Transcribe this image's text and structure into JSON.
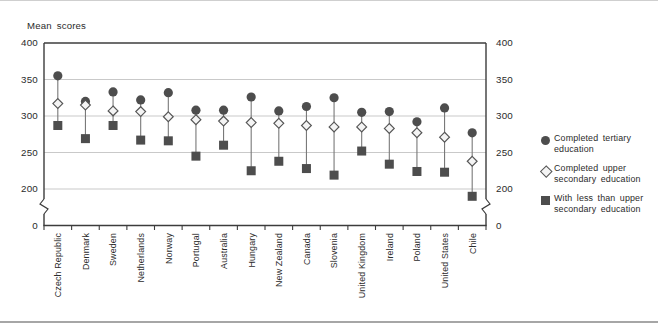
{
  "figure": {
    "background": "#ffffff",
    "edge_top_color": "#cfcfcf",
    "edge_bottom_color": "#a6a6a6"
  },
  "chart_data": {
    "type": "scatter",
    "subtype": "dot-range-plot",
    "title": "Mean scores",
    "categories": [
      "Czech Republic",
      "Denmark",
      "Sweden",
      "Netherlands",
      "Norway",
      "Portugal",
      "Australia",
      "Hungary",
      "New Zealand",
      "Canada",
      "Slovenia",
      "United Kingdom",
      "Ireland",
      "Poland",
      "United States",
      "Chile"
    ],
    "series": [
      {
        "name": "Completed tertiary education",
        "marker": "circle",
        "values": [
          355,
          320,
          333,
          322,
          332,
          308,
          308,
          326,
          307,
          313,
          325,
          305,
          306,
          292,
          311,
          277
        ]
      },
      {
        "name": "Completed upper secondary education",
        "marker": "diamond",
        "values": [
          317,
          315,
          307,
          306,
          299,
          295,
          293,
          291,
          290,
          287,
          285,
          285,
          283,
          277,
          271,
          238
        ]
      },
      {
        "name": "With less than upper secondary education",
        "marker": "square",
        "values": [
          287,
          269,
          287,
          267,
          266,
          245,
          260,
          225,
          238,
          228,
          219,
          252,
          234,
          224,
          223,
          190
        ]
      }
    ],
    "y_axis": {
      "ticks": [
        400,
        350,
        300,
        250,
        200
      ],
      "baseline_tick": 0,
      "visible_range": [
        200,
        400
      ],
      "axis_break": true,
      "dual_sided": true
    },
    "x_axis": {
      "label_rotation_deg": 90
    },
    "grid": true,
    "legend_position": "right",
    "colors": {
      "marker": "#4d4d4d",
      "diamond_fill": "#f4f4f4",
      "diamond_stroke": "#565656",
      "connector": "#787878",
      "grid": "#c9c9c9",
      "axis": "#3c3c3c",
      "text": "#2b2b2b"
    }
  },
  "legend": {
    "items": [
      {
        "marker": "circle",
        "line1": "Completed tertiary",
        "line2": "education"
      },
      {
        "marker": "diamond",
        "line1": "Completed upper",
        "line2": "secondary education"
      },
      {
        "marker": "square",
        "line1": "With less than upper",
        "line2": "secondary education"
      }
    ]
  }
}
